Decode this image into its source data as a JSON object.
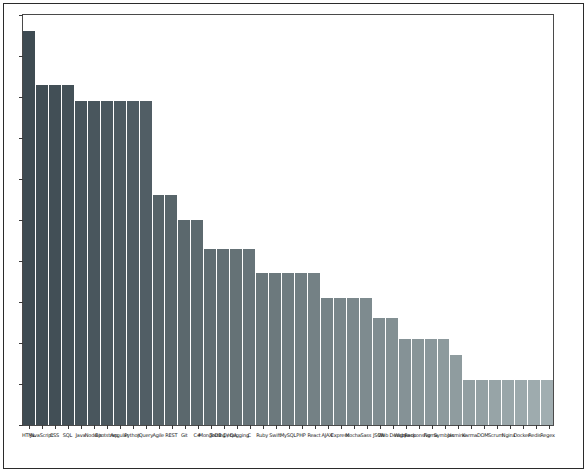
{
  "figure": {
    "background": "#ffffff",
    "frame_color": "#2b2b2b",
    "axes_color": "#4a4a4a",
    "title": "",
    "has_grid": false,
    "has_legend": false
  },
  "chart_data": {
    "type": "bar",
    "title": "",
    "xlabel": "",
    "ylabel": "",
    "ylim": [
      0,
      1000
    ],
    "grid": false,
    "legend": false,
    "orientation": "vertical",
    "sorted": "descending",
    "colormap": "viridis-sequential-dark-to-light",
    "xtick_rotation": 0,
    "xtick_fontsize": 5,
    "note_ytick_labels": "none visible",
    "ytick_count": 11,
    "categories": [
      "HTML",
      "JavaScript",
      "CSS",
      "SQL",
      "Java",
      "Node.js",
      "Bootstrap",
      "Angular",
      "Python",
      "jQuery",
      "Agile",
      "REST",
      "Git",
      "C#",
      "MongoDB",
      "Testing / QA",
      "Debugging",
      "C",
      "Ruby",
      "Swift",
      "MySQL",
      "PHP",
      "React",
      "AJAX",
      "Express",
      "Mocha",
      "Sass",
      "JSON",
      "Web Design",
      "Webpack",
      "Responsive",
      "Figma",
      "Symbols",
      "Jasmine",
      "Karma",
      "DOM",
      "Scrum",
      "Nginx",
      "Docker",
      "Redis",
      "Regex"
    ],
    "values": [
      960,
      830,
      830,
      830,
      790,
      790,
      790,
      790,
      790,
      790,
      560,
      560,
      500,
      500,
      430,
      430,
      430,
      430,
      370,
      370,
      370,
      370,
      370,
      310,
      310,
      310,
      310,
      260,
      260,
      210,
      210,
      210,
      210,
      170,
      110,
      110,
      110,
      110,
      110,
      110,
      110
    ],
    "colors": [
      "#3e4b52",
      "#404d54",
      "#424f56",
      "#445158",
      "#47545b",
      "#49565d",
      "#4b585f",
      "#4d5a61",
      "#4f5c63",
      "#515e65",
      "#566368",
      "#58656a",
      "#5b686d",
      "#5d6a6f",
      "#606d72",
      "#626f74",
      "#657276",
      "#677479",
      "#6a777b",
      "#6c797d",
      "#6f7c80",
      "#717e82",
      "#748185",
      "#768387",
      "#79868a",
      "#7b888c",
      "#7e8b8f",
      "#808d91",
      "#839093",
      "#859296",
      "#889598",
      "#8a979b",
      "#8d9a9d",
      "#8f9c9f",
      "#929fa2",
      "#94a1a4",
      "#97a4a7",
      "#99a6a9",
      "#9ca9ac",
      "#9eabae",
      "#a1aeb1"
    ]
  }
}
